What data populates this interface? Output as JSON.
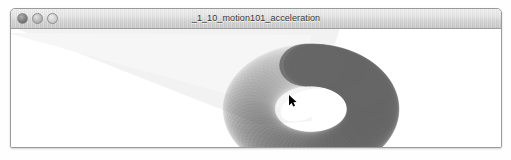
{
  "window": {
    "title": "_1_10_motion101_acceleration",
    "controls": [
      {
        "name": "close",
        "icon": "close-button-icon",
        "color": "#6f6f6f"
      },
      {
        "name": "minimize",
        "icon": "minimize-button-icon",
        "color": "#adadad"
      },
      {
        "name": "maximize",
        "icon": "maximize-button-icon",
        "color": "#c8c8c8"
      }
    ]
  },
  "sketch": {
    "name": "motion101-acceleration-canvas",
    "background": "#ffffff",
    "trail_color": "#666666",
    "wedge_color": "#f2f2f2",
    "cursor": {
      "x": 288,
      "y": 86,
      "color": "#000000"
    },
    "spiral": {
      "center_x": 300,
      "center_y": 80,
      "radius_x": 62,
      "radius_y": 44,
      "ellipse_rx": 26,
      "ellipse_ry": 21,
      "count": 96,
      "turns": 1.08,
      "start_angle": -95
    }
  }
}
